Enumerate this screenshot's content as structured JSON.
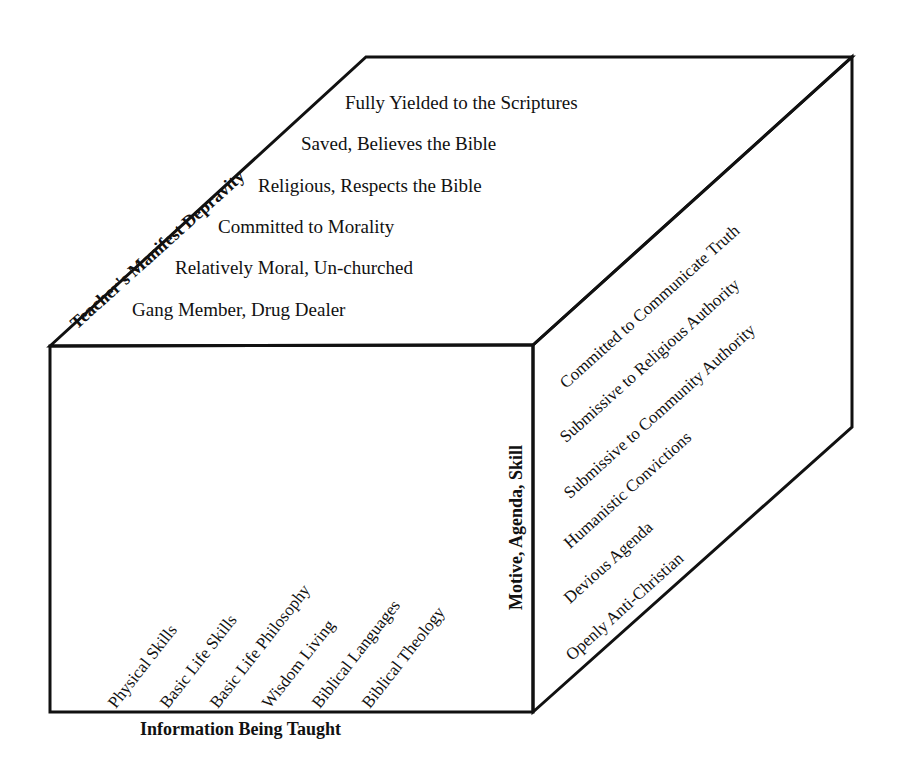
{
  "diagram": {
    "type": "3d-cube-model",
    "axes": {
      "depth_top": "Teacher's Manifest Depravity",
      "vertical_right": "Motive, Agenda, Skill",
      "bottom": "Information Being Taught"
    },
    "top_face_items": [
      "Fully Yielded to the Scriptures",
      "Saved, Believes the Bible",
      "Religious, Respects the Bible",
      "Committed to Morality",
      "Relatively Moral, Un-churched",
      "Gang Member, Drug Dealer"
    ],
    "right_face_items": [
      "Committed to Communicate Truth",
      "Submissive to Religious Authority",
      "Submissive to Community Authority",
      "Humanistic Convictions",
      "Devious Agenda",
      "Openly Anti-Christian"
    ],
    "front_face_items": [
      "Physical Skills",
      "Basic Life Skills",
      "Basic Life Philosophy",
      "Wisdom Living",
      "Biblical Languages",
      "Biblical Theology"
    ],
    "colors": {
      "line": "#111111",
      "background": "#ffffff",
      "text": "#111111"
    }
  }
}
